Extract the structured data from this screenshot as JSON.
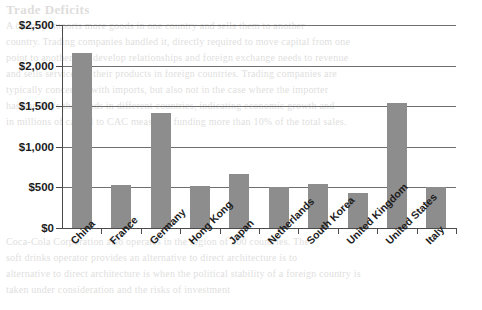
{
  "chart_data": {
    "type": "bar",
    "title": "",
    "subtitle": "",
    "xlabel": "",
    "ylabel": "",
    "categories": [
      "China",
      "France",
      "Germany",
      "Hong Kong",
      "Japan",
      "Netherlands",
      "South Korea",
      "United Kingdom",
      "United States",
      "Italy"
    ],
    "values": [
      2150,
      525,
      1420,
      520,
      665,
      500,
      545,
      430,
      1540,
      500
    ],
    "ylim": [
      0,
      2500
    ],
    "ytick_values": [
      0,
      500,
      1000,
      1500,
      2000,
      2500
    ],
    "ytick_labels": [
      "$0",
      "$500",
      "$1,000",
      "$1,500",
      "$2,000",
      "$2,500"
    ],
    "grid": true,
    "legend": false,
    "bar_color": "#8d8d8d",
    "axis_color": "#4b4b4b",
    "gridline_color": "#6f6f6f"
  },
  "page_bleed": {
    "heading": "Trade Deficits",
    "lines": [
      "A country imports more goods in one country and sells them to another",
      "country. Trading companies handled it, directly required to move capital from one",
      "point to another and develop relationships and foreign exchange needs to revenue",
      "and sells services of their products in foreign countries. Trading companies are",
      "typically concerned with imports, but also not in the case where the importer",
      "has and buys the goods in different countries, indicating economic growth and",
      "in millions of capital to CAC measured funding more than 10% of the total sales.",
      "Coca-Cola Corporation also operates in the region of 200 countries. The",
      "soft drinks operator provides an alternative to direct architecture is to",
      "alternative to direct architecture is when the political stability of a foreign country is",
      "taken under consideration and the risks of investment"
    ]
  }
}
